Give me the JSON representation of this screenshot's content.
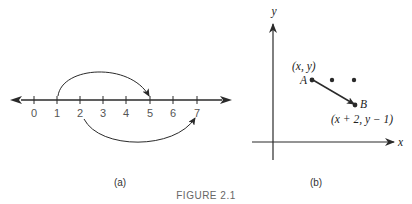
{
  "figure": {
    "title": "FIGURE 2.1",
    "panel_a": {
      "caption": "(a)",
      "number_line": {
        "ticks": [
          "0",
          "1",
          "2",
          "3",
          "4",
          "5",
          "6",
          "7"
        ],
        "arrows": "both-ends"
      },
      "arcs": [
        {
          "from": "1",
          "to": "5",
          "side": "above"
        },
        {
          "from": "2",
          "to": "7",
          "side": "below"
        }
      ]
    },
    "panel_b": {
      "caption": "(b)",
      "axes": {
        "x_label": "x",
        "y_label": "y"
      },
      "points": {
        "A": {
          "label": "A",
          "coord_label": "(x, y)"
        },
        "B": {
          "label": "B",
          "coord_label": "(x + 2, y − 1)"
        }
      },
      "extra_dots": 2
    }
  },
  "colors": {
    "ink": "#2a2a2a",
    "label": "#555555"
  }
}
